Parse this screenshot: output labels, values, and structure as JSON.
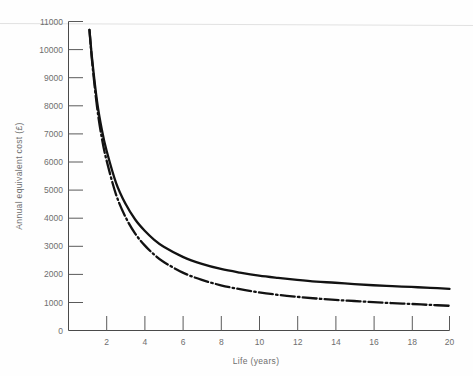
{
  "chart_data": {
    "type": "line",
    "title": "",
    "xlabel": "Life (years)",
    "ylabel": "Annual equivalent cost (£)",
    "xlim": [
      0,
      20
    ],
    "ylim": [
      0,
      11000
    ],
    "grid": false,
    "legend": "none",
    "x_ticks": [
      2,
      4,
      6,
      8,
      10,
      12,
      14,
      16,
      18,
      20
    ],
    "x_tick_labels": [
      "2",
      "4",
      "6",
      "8",
      "10",
      "12",
      "14",
      "16",
      "18",
      "20"
    ],
    "y_ticks": [
      0,
      1000,
      2000,
      3000,
      4000,
      5000,
      6000,
      7000,
      8000,
      9000,
      10000,
      11000
    ],
    "y_tick_labels": [
      "0",
      "1000",
      "2000",
      "3000",
      "4000",
      "5000",
      "6000",
      "7000",
      "8000",
      "9000",
      "10000",
      "11000"
    ],
    "x": [
      1.1,
      1.25,
      1.5,
      1.75,
      2,
      2.5,
      3,
      3.5,
      4,
      4.5,
      5,
      6,
      7,
      8,
      9,
      10,
      11,
      12,
      13,
      14,
      15,
      16,
      17,
      18,
      19,
      20
    ],
    "series": [
      {
        "name": "upper-curve",
        "style": "solid",
        "values": [
          10700,
          9600,
          8150,
          7150,
          6400,
          5250,
          4500,
          3950,
          3550,
          3230,
          2980,
          2620,
          2370,
          2190,
          2060,
          1950,
          1870,
          1800,
          1740,
          1700,
          1650,
          1610,
          1580,
          1550,
          1520,
          1480
        ]
      },
      {
        "name": "lower-curve",
        "style": "dash-dot",
        "values": [
          10700,
          9500,
          7950,
          6850,
          6050,
          4830,
          4030,
          3450,
          3030,
          2700,
          2440,
          2060,
          1800,
          1610,
          1470,
          1360,
          1270,
          1200,
          1140,
          1090,
          1050,
          1010,
          975,
          945,
          910,
          880
        ]
      }
    ]
  },
  "axes": {
    "x_axis_name": "life-years-axis",
    "y_axis_name": "annual-equivalent-cost-axis"
  }
}
